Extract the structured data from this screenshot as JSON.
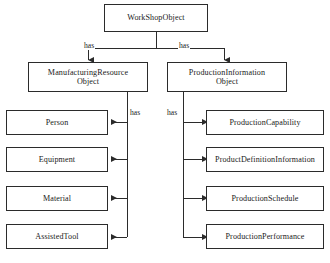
{
  "diagram": {
    "type": "tree-diagram",
    "stroke_color": "#2b2b2b",
    "background_color": "#ffffff",
    "nodes": {
      "root": "WorkShopObject",
      "manufacturing_resource": "ManufacturingResource\nObject",
      "production_information": "ProductionInformation\nObject",
      "person": "Person",
      "equipment": "Equipment",
      "material": "Material",
      "assisted_tool": "AssistedTool",
      "production_capability": "ProductionCapability",
      "product_definition_information": "ProductDefinitionInformation",
      "production_schedule": "ProductionSchedule",
      "production_performance": "ProductionPerformance"
    },
    "edge_labels": {
      "root_to_manufacturing": "has",
      "root_to_production": "has",
      "manufacturing_to_children": "has",
      "production_to_children": "has"
    },
    "edges": [
      {
        "from": "root",
        "to": "manufacturing_resource",
        "label": "has"
      },
      {
        "from": "root",
        "to": "production_information",
        "label": "has"
      },
      {
        "from": "manufacturing_resource",
        "to": "person",
        "label": "has"
      },
      {
        "from": "manufacturing_resource",
        "to": "equipment",
        "label": "has"
      },
      {
        "from": "manufacturing_resource",
        "to": "material",
        "label": "has"
      },
      {
        "from": "manufacturing_resource",
        "to": "assisted_tool",
        "label": "has"
      },
      {
        "from": "production_information",
        "to": "production_capability",
        "label": "has"
      },
      {
        "from": "production_information",
        "to": "product_definition_information",
        "label": "has"
      },
      {
        "from": "production_information",
        "to": "production_schedule",
        "label": "has"
      },
      {
        "from": "production_information",
        "to": "production_performance",
        "label": "has"
      }
    ]
  }
}
